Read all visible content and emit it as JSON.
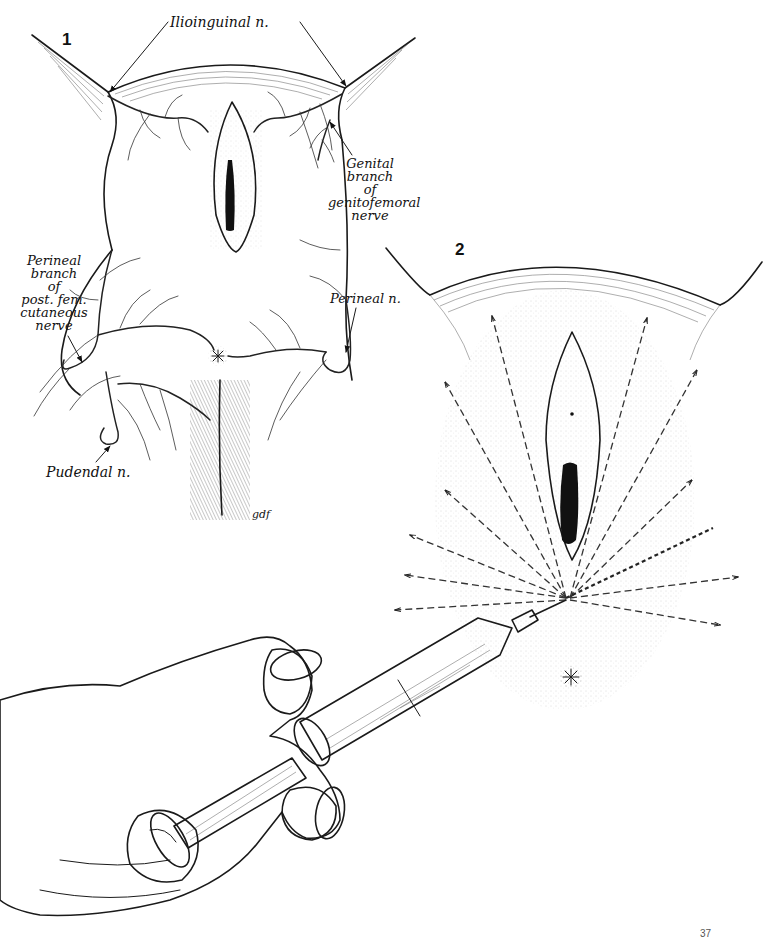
{
  "figures": [
    {
      "number": "1",
      "subject": "Nerve supply of the perineum",
      "labels": {
        "ilioinguinal": "Ilioinguinal n.",
        "genital_branch": [
          "Genital",
          "branch",
          "of",
          "genitofemoral",
          "nerve"
        ],
        "perineal_branch": [
          "Perineal",
          "branch",
          "of",
          "post. fem.",
          "cutaneous",
          "nerve"
        ],
        "perineal": "Perineal n.",
        "pudendal": "Pudendal n."
      },
      "artist_signature": "gdf"
    },
    {
      "number": "2",
      "subject": "Local infiltration with ring-handled syringe; dashed lines show needle tracks",
      "needle_tracks": 12
    }
  ],
  "page_number": "37"
}
